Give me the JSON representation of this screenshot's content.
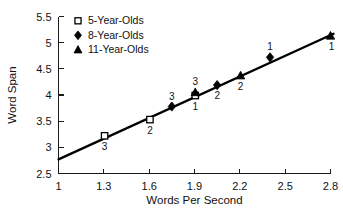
{
  "chart_data": {
    "type": "scatter",
    "title": "",
    "xlabel": "Words Per Second",
    "ylabel": "Word Span",
    "xlim": [
      1,
      2.8
    ],
    "ylim": [
      2.5,
      5.5
    ],
    "xticks": [
      "1",
      "1.3",
      "1.6",
      "1.9",
      "2.2",
      "2.5",
      "2.8"
    ],
    "xtick_values": [
      1,
      1.3,
      1.6,
      1.9,
      2.2,
      2.5,
      2.8
    ],
    "yticks": [
      "2.5",
      "3",
      "3.5",
      "4",
      "4.5",
      "5",
      "5.5"
    ],
    "ytick_values": [
      2.5,
      3,
      3.5,
      4,
      4.5,
      5,
      5.5
    ],
    "grid": false,
    "legend_position": "top-left",
    "legend": [
      {
        "label": "5-Year-Olds",
        "marker": "open-square"
      },
      {
        "label": "8-Year-Olds",
        "marker": "filled-diamond"
      },
      {
        "label": "11-Year-Olds",
        "marker": "filled-triangle"
      }
    ],
    "series": [
      {
        "name": "5-Year-Olds",
        "marker": "open-square",
        "points": [
          {
            "x": 1.305,
            "y": 3.22,
            "label": "3",
            "label_pos": "below"
          },
          {
            "x": 1.605,
            "y": 3.53,
            "label": "2",
            "label_pos": "below"
          },
          {
            "x": 1.905,
            "y": 3.99,
            "label": "1",
            "label_pos": "below"
          }
        ]
      },
      {
        "name": "8-Year-Olds",
        "marker": "filled-diamond",
        "points": [
          {
            "x": 1.75,
            "y": 3.78,
            "label": "3",
            "label_pos": "above"
          },
          {
            "x": 2.05,
            "y": 4.19,
            "label": "2",
            "label_pos": "below"
          },
          {
            "x": 2.4,
            "y": 4.72,
            "label": "1",
            "label_pos": "above"
          }
        ]
      },
      {
        "name": "11-Year-Olds",
        "marker": "filled-triangle",
        "points": [
          {
            "x": 1.905,
            "y": 4.05,
            "label": "3",
            "label_pos": "above"
          },
          {
            "x": 2.205,
            "y": 4.37,
            "label": "2",
            "label_pos": "below"
          },
          {
            "x": 2.8,
            "y": 5.13,
            "label": "1",
            "label_pos": "below-right"
          }
        ]
      }
    ],
    "trend_line": {
      "x0": 1.0,
      "y0": 2.77,
      "x1": 2.82,
      "y1": 5.17
    },
    "colors": {
      "ink": "#000000",
      "axis": "#1a1a1a",
      "background": "#ffffff"
    }
  }
}
